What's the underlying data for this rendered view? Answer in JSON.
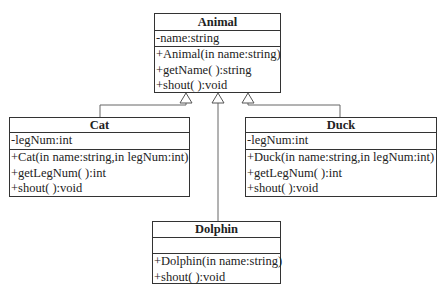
{
  "diagram": {
    "type": "uml-class-diagram",
    "relationship": "generalization",
    "classes": [
      {
        "name": "Animal",
        "attributes": [
          "-name:string"
        ],
        "operations": [
          "+Animal(in name:string)",
          "+getName( ):string",
          "+shout( ):void"
        ]
      },
      {
        "name": "Cat",
        "attributes": [
          "-legNum:int"
        ],
        "operations": [
          "+Cat(in name:string,in legNum:int)",
          "+getLegNum( ):int",
          "+shout( ):void"
        ]
      },
      {
        "name": "Duck",
        "attributes": [
          "-legNum:int"
        ],
        "operations": [
          "+Duck(in name:string,in legNum:int)",
          "+getLegNum( ):int",
          "+shout( ):void"
        ]
      },
      {
        "name": "Dolphin",
        "attributes": [],
        "operations": [
          "+Dolphin(in name:string)",
          "+shout( ):void"
        ]
      }
    ],
    "edges": [
      {
        "from": "Cat",
        "to": "Animal",
        "kind": "inheritance"
      },
      {
        "from": "Dolphin",
        "to": "Animal",
        "kind": "inheritance"
      },
      {
        "from": "Duck",
        "to": "Animal",
        "kind": "inheritance"
      }
    ]
  }
}
